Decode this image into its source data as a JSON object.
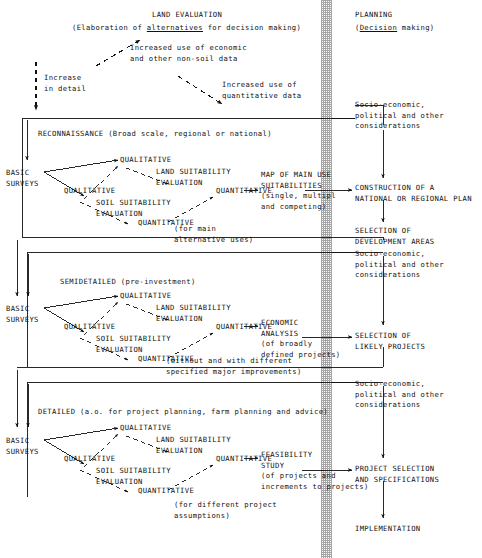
{
  "diagram": {
    "title_left": "LAND EVALUATION",
    "subtitle_left_pre": "(Elaboration of ",
    "subtitle_left_em": "alternatives",
    "subtitle_left_post": " for decision making)",
    "title_right": "PLANNING",
    "subtitle_right_pre": "(",
    "subtitle_right_em": "Decision",
    "subtitle_right_post": " making)",
    "note_economic": "Increased use of economic\nand other non-soil data",
    "note_quantitative": "Increased use of\nquantitative data",
    "increase_detail": "Increase\nin detail",
    "separator": "hatched-vertical-band"
  },
  "sections": [
    {
      "id": "reconnaissance",
      "heading": "RECONNAISSANCE (Broad scale, regional or national)",
      "basic_surveys": "BASIC\nSURVEYS",
      "land_suitability": "LAND SUITABILITY\nEVALUATION",
      "soil_suitability": "SOIL SUITABILITY\nEVALUATION",
      "qual_top": "QUALITATIVE",
      "quant_top": "QUANTITATIVE",
      "qual_bottom": "QUALITATIVE",
      "quant_bottom": "QUANTITATIVE",
      "output": "MAP OF MAIN USE\nSUITABILITIES\n(single, multipl\nand competing)",
      "footnote": "(for main\nalternative uses)"
    },
    {
      "id": "semidetailed",
      "heading": "SEMIDETAILED (pre-investment)",
      "basic_surveys": "BASIC\nSURVEYS",
      "land_suitability": "LAND SUITABILITY\nEVALUATION",
      "soil_suitability": "SOIL SUITABILITY\nEVALUATION",
      "qual_top": "QUALITATIVE",
      "quant_top": "QUANTITATIVE",
      "qual_bottom": "QUALITATIVE",
      "quant_bottom": "QUANTITATIVE",
      "output": "ECONOMIC\nANALYSIS\n(of broadly\ndefined projects)",
      "footnote": "(without and with different\nspecified major improvements)"
    },
    {
      "id": "detailed",
      "heading": "DETAILED (a.o. for project planning, farm planning and advice)",
      "basic_surveys": "BASIC\nSURVEYS",
      "land_suitability": "LAND SUITABILITY\nEVALUATION",
      "soil_suitability": "SOIL SUITABILITY\nEVALUATION",
      "qual_top": "QUALITATIVE",
      "quant_top": "QUANTITATIVE",
      "qual_bottom": "QUALITATIVE",
      "quant_bottom": "QUANTITATIVE",
      "output": "FEASIBILITY\nSTUDY\n(of projects and\nincrements to projects)",
      "footnote": "(for different project\nassumptions)"
    }
  ],
  "planning_column": {
    "considerations_1": "Socio-economic,\npolitical and other\nconsiderations",
    "considerations_2": "Socio-economic,\npolitical and other\nconsiderations",
    "considerations_3": "Socio-economic,\npolitical and other\nconsiderations",
    "step_1": "CONSTRUCTION OF A\nNATIONAL OR REGIONAL PLAN",
    "step_2": "SELECTION OF\nDEVELOPMENT AREAS",
    "step_3": "SELECTION OF\nLIKELY PROJECTS",
    "step_4": "PROJECT SELECTION\nAND SPECIFICATIONS",
    "step_5": "IMPLEMENTATION"
  },
  "colors": {
    "ink": "#121212",
    "band": "#6f6f6f",
    "background": "#ffffff"
  }
}
